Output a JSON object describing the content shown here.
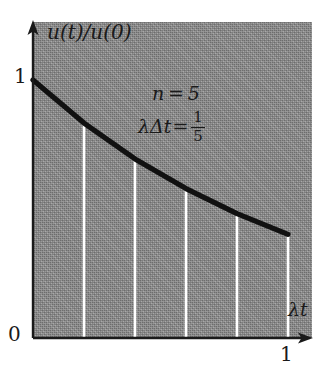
{
  "figure": {
    "background_color": "#ffffff",
    "panel_color": "#8e8e8e",
    "curve_color": "#111111",
    "gridline_color": "#ffffff"
  },
  "axes": {
    "y_label": "u(t)/u(0)",
    "x_label": "λt",
    "origin_label": "0",
    "y_tick_label": "1",
    "x_tick_label": "1"
  },
  "annotation": {
    "line1": "n = 5",
    "line2_lhs": "λΔt",
    "line2_eq": "=",
    "fraction_numerator": "1",
    "fraction_denominator": "5"
  },
  "chart_data": {
    "type": "line",
    "title": "",
    "xlabel": "λt",
    "ylabel": "u(t)/u(0)",
    "xlim": [
      0,
      1
    ],
    "ylim": [
      0,
      1
    ],
    "xticks": [
      0,
      1
    ],
    "xticklabels": [
      "0",
      "1"
    ],
    "yticks": [
      0,
      1
    ],
    "yticklabels": [
      "0",
      "1"
    ],
    "grid": false,
    "legend": null,
    "parameters": {
      "n": 5,
      "lambda_delta_t": 0.2
    },
    "series": [
      {
        "name": "u(t)/u(0)",
        "x": [
          0,
          0.2,
          0.4,
          0.6,
          0.8,
          1.0
        ],
        "values": [
          1.0,
          0.833,
          0.694,
          0.579,
          0.482,
          0.402
        ]
      }
    ],
    "dropline_x": [
      0.2,
      0.4,
      0.6,
      0.8,
      1.0
    ],
    "dropline_tops": [
      0.833,
      0.694,
      0.579,
      0.482,
      0.402
    ],
    "annotations": [
      "n = 5",
      "λΔt = 1/5"
    ]
  }
}
